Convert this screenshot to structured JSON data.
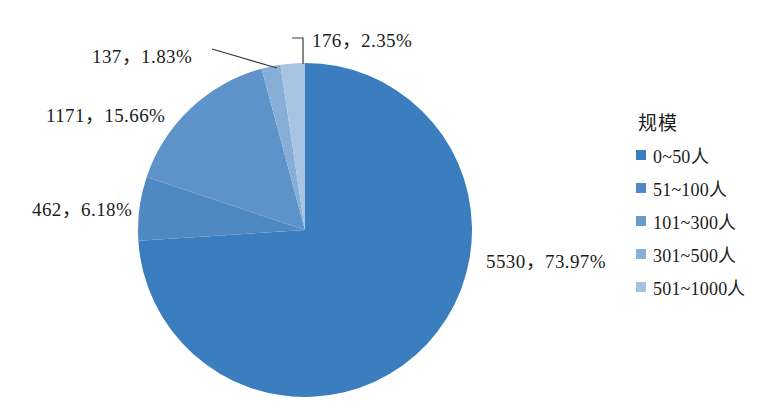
{
  "chart_data": {
    "type": "pie",
    "title": "",
    "legend_title": "规模",
    "legend_position": "right",
    "categories": [
      "0~50人",
      "51~100人",
      "101~300人",
      "301~500人",
      "501~1000人"
    ],
    "values": [
      5530,
      462,
      1171,
      137,
      176
    ],
    "percents": [
      73.97,
      6.18,
      15.66,
      1.83,
      2.35
    ],
    "colors": [
      "#3a7ebf",
      "#4f89c4",
      "#5e93c9",
      "#87aed7",
      "#a8c4e2"
    ],
    "total": 7476,
    "start_angle_deg": 0,
    "direction": "counterclockwise",
    "slices": [
      {
        "label": "0~50人",
        "value": 5530,
        "percent": 73.97,
        "color": "#3a7ebf",
        "data_label": "5530，73.97%"
      },
      {
        "label": "51~100人",
        "value": 462,
        "percent": 6.18,
        "color": "#4f89c4",
        "data_label": "462，6.18%"
      },
      {
        "label": "101~300人",
        "value": 1171,
        "percent": 15.66,
        "color": "#5e93c9",
        "data_label": "1171，15.66%"
      },
      {
        "label": "301~500人",
        "value": 137,
        "percent": 1.83,
        "color": "#87aed7",
        "data_label": "137，1.83%"
      },
      {
        "label": "501~1000人",
        "value": 176,
        "percent": 2.35,
        "color": "#a8c4e2",
        "data_label": "176，2.35%"
      }
    ]
  },
  "labels": {
    "l176": "176，2.35%",
    "l137": "137，1.83%",
    "l1171": "1171，15.66%",
    "l462": "462，6.18%",
    "l5530": "5530，73.97%"
  },
  "legend": {
    "title": "规模",
    "items": [
      {
        "label": "0~50人",
        "color": "#3a7ebf"
      },
      {
        "label": "51~100人",
        "color": "#4f89c4"
      },
      {
        "label": "101~300人",
        "color": "#6a9bcd"
      },
      {
        "label": "301~500人",
        "color": "#89b0d8"
      },
      {
        "label": "501~1000人",
        "color": "#a5c2e0"
      }
    ]
  }
}
